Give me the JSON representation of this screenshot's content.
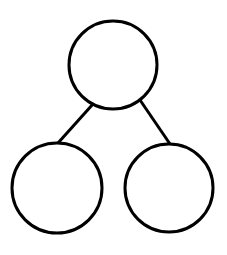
{
  "diagram": {
    "type": "tree",
    "background": "#ffffff",
    "stroke_color": "#000000",
    "stroke_width": 3,
    "nodes": [
      {
        "id": "root",
        "label": "",
        "cx": 113,
        "cy": 65,
        "r": 44
      },
      {
        "id": "left-child",
        "label": "",
        "cx": 57,
        "cy": 188,
        "r": 45
      },
      {
        "id": "right-child",
        "label": "",
        "cx": 169,
        "cy": 188,
        "r": 44
      }
    ],
    "edges": [
      {
        "from": "root",
        "to": "left-child",
        "x1": 93,
        "y1": 104,
        "x2": 58,
        "y2": 143
      },
      {
        "from": "root",
        "to": "right-child",
        "x1": 140,
        "y1": 100,
        "x2": 170,
        "y2": 144
      }
    ]
  }
}
